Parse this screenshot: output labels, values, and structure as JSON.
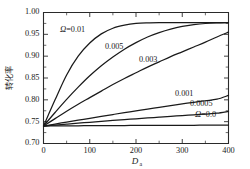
{
  "chart_data": {
    "type": "line",
    "title": "",
    "xlabel": "Da",
    "xlabel_main": "D",
    "xlabel_sub": "a",
    "ylabel": "转化率",
    "xlim": [
      0,
      400
    ],
    "ylim": [
      0.7,
      1.0
    ],
    "grid": false,
    "legend": "inline-annotations",
    "xticks": [
      0,
      100,
      200,
      300,
      400
    ],
    "xtick_labels": [
      "0",
      "100",
      "200",
      "300",
      "400"
    ],
    "xminor_step": 50,
    "yticks": [
      0.7,
      0.75,
      0.8,
      0.85,
      0.9,
      0.95,
      1.0
    ],
    "ytick_labels": [
      "0.70",
      "0.75",
      "0.80",
      "0.85",
      "0.90",
      "0.95",
      "1.00"
    ],
    "yminor_step": 0.025,
    "x": [
      0,
      25,
      50,
      75,
      100,
      125,
      150,
      175,
      200,
      225,
      250,
      275,
      300,
      325,
      350,
      375,
      400
    ],
    "series": [
      {
        "name": "Omega = 0.01",
        "label": "Ω=0.01",
        "label_omega": "Ω",
        "label_value": "=0.01",
        "values": [
          0.74,
          0.8,
          0.857,
          0.9,
          0.93,
          0.951,
          0.964,
          0.971,
          0.975,
          0.9765,
          0.977,
          0.977,
          0.977,
          0.977,
          0.977,
          0.977,
          0.977
        ]
      },
      {
        "name": "Omega = 0.005",
        "label": "0.005",
        "values": [
          0.74,
          0.771,
          0.801,
          0.829,
          0.855,
          0.878,
          0.898,
          0.916,
          0.931,
          0.944,
          0.954,
          0.962,
          0.968,
          0.972,
          0.9748,
          0.9762,
          0.977
        ]
      },
      {
        "name": "Omega = 0.003",
        "label": "0.003",
        "values": [
          0.74,
          0.757,
          0.774,
          0.79,
          0.805,
          0.82,
          0.835,
          0.849,
          0.862,
          0.875,
          0.887,
          0.899,
          0.91,
          0.921,
          0.932,
          0.944,
          0.955
        ]
      },
      {
        "name": "Omega = 0.001",
        "label": "0.001",
        "values": [
          0.74,
          0.7445,
          0.749,
          0.7534,
          0.7578,
          0.7621,
          0.7664,
          0.7706,
          0.7748,
          0.7789,
          0.7829,
          0.7868,
          0.7906,
          0.7943,
          0.7979,
          0.8014,
          0.81
        ]
      },
      {
        "name": "Omega = 0.0005",
        "label": "0.0005",
        "values": [
          0.74,
          0.7422,
          0.7444,
          0.7465,
          0.7486,
          0.7507,
          0.7527,
          0.7547,
          0.7566,
          0.7585,
          0.7604,
          0.7622,
          0.764,
          0.7657,
          0.7675,
          0.7694,
          0.7735
        ]
      },
      {
        "name": "Omega = 0.0",
        "label": "Ω=0.0",
        "label_omega": "Ω",
        "label_value": "=0.0",
        "values": [
          0.74,
          0.7402,
          0.7404,
          0.7406,
          0.7408,
          0.7409,
          0.7411,
          0.7412,
          0.7413,
          0.7414,
          0.7415,
          0.7416,
          0.7417,
          0.7418,
          0.7419,
          0.742,
          0.7421
        ]
      }
    ],
    "colors": {
      "curve": "#1a1a1a",
      "axis": "#2a2a2a",
      "background": "#ffffff"
    }
  }
}
